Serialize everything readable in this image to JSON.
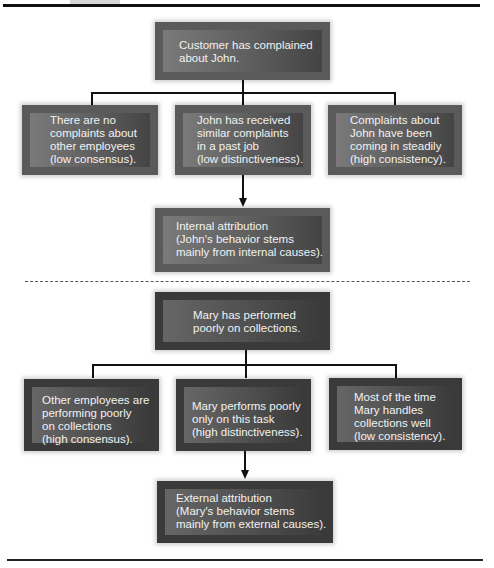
{
  "figure": {
    "section_john": {
      "root": "Customer has complained\nabout John.",
      "causes": [
        "There are no\ncomplaints about\nother employees\n(low consensus).",
        "John has received\nsimilar complaints\nin a past job\n(low distinctiveness).",
        "Complaints about\nJohn have been\ncoming in steadily\n(high consistency)."
      ],
      "conclusion": "Internal attribution\n(John's behavior stems\nmainly from internal causes)."
    },
    "section_mary": {
      "root": "Mary has performed\npoorly on collections.",
      "causes": [
        "Other employees are\nperforming poorly\non collections\n(high consensus).",
        "Mary performs poorly\nonly on this task\n(high distinctiveness).",
        "Most of the time\nMary handles\ncollections well\n(low consistency)."
      ],
      "conclusion": "External attribution\n(Mary's behavior stems\nmainly from external causes)."
    }
  }
}
